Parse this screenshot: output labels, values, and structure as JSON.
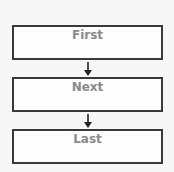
{
  "diagram": {
    "type": "flowchart",
    "nodes": [
      {
        "id": "first",
        "label": "First"
      },
      {
        "id": "next",
        "label": "Next"
      },
      {
        "id": "last",
        "label": "Last"
      }
    ],
    "edges": [
      {
        "from": "first",
        "to": "next"
      },
      {
        "from": "next",
        "to": "last"
      }
    ],
    "colors": {
      "border": "#3a3a3a",
      "text": "#8a8a8a",
      "background": "#f7f7f7"
    }
  }
}
